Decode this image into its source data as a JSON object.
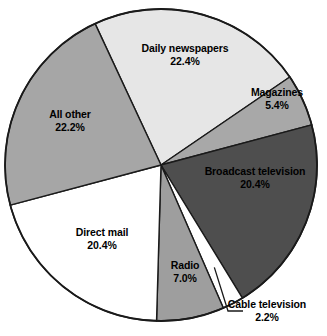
{
  "chart_data": {
    "type": "pie",
    "title": "",
    "subtitle": "",
    "xlabel": "",
    "ylabel": "",
    "legend_position": "none",
    "grid": false,
    "units": "percent",
    "categories": [
      "Daily newspapers",
      "Magazines",
      "Broadcast television",
      "Cable television",
      "Radio",
      "Direct mail",
      "All other"
    ],
    "values": [
      22.4,
      5.4,
      20.4,
      2.2,
      7.0,
      20.4,
      22.2
    ],
    "value_labels": [
      "22.4%",
      "5.4%",
      "20.4%",
      "2.2%",
      "7.0%",
      "20.4%",
      "22.2%"
    ],
    "colors": [
      "#e6e6e6",
      "#a8a8a8",
      "#4e4e4e",
      "#ffffff",
      "#9e9e9e",
      "#ffffff",
      "#a6a6a6"
    ],
    "start_angle_deg": -25,
    "direction": "clockwise",
    "slices": [
      {
        "name": "Daily newspapers",
        "value": 22.4,
        "value_label": "22.4%",
        "color": "#e6e6e6",
        "label_placement": "inside"
      },
      {
        "name": "Magazines",
        "value": 5.4,
        "value_label": "5.4%",
        "color": "#a8a8a8",
        "label_placement": "inside"
      },
      {
        "name": "Broadcast television",
        "value": 20.4,
        "value_label": "20.4%",
        "color": "#4e4e4e",
        "label_placement": "inside"
      },
      {
        "name": "Cable television",
        "value": 2.2,
        "value_label": "2.2%",
        "color": "#ffffff",
        "label_placement": "outside-leader"
      },
      {
        "name": "Radio",
        "value": 7.0,
        "value_label": "7.0%",
        "color": "#9e9e9e",
        "label_placement": "inside"
      },
      {
        "name": "Direct mail",
        "value": 20.4,
        "value_label": "20.4%",
        "color": "#ffffff",
        "label_placement": "inside"
      },
      {
        "name": "All other",
        "value": 22.2,
        "value_label": "22.2%",
        "color": "#a6a6a6",
        "label_placement": "inside"
      }
    ]
  },
  "geometry": {
    "center_x": 161,
    "center_y": 165,
    "radius": 156
  },
  "label_positions": [
    {
      "x": 185,
      "y": 54,
      "align": "center"
    },
    {
      "x": 277,
      "y": 98,
      "align": "center"
    },
    {
      "x": 255,
      "y": 177,
      "align": "center"
    },
    {
      "x": 267,
      "y": 310,
      "align": "center"
    },
    {
      "x": 185,
      "y": 271,
      "align": "center"
    },
    {
      "x": 102,
      "y": 238,
      "align": "center"
    },
    {
      "x": 70,
      "y": 120,
      "align": "center"
    }
  ]
}
